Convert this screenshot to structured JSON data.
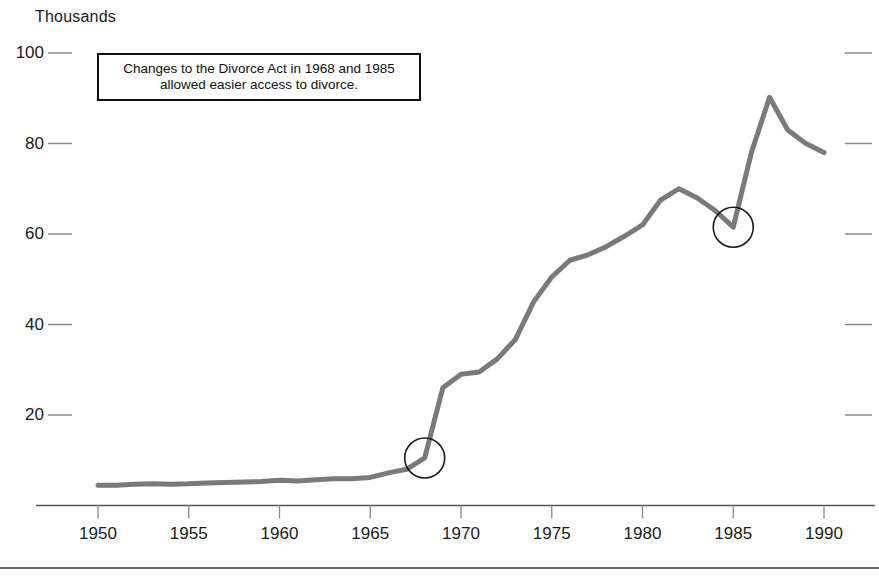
{
  "chart_data": {
    "type": "line",
    "title": "",
    "subtitle": "",
    "xlabel": "",
    "ylabel": "Thousands",
    "unit_label": "Thousands",
    "xlim": [
      1950,
      1990
    ],
    "ylim": [
      0,
      100
    ],
    "grid": false,
    "legend": null,
    "line_color": "#7a7a7a",
    "axis_color": "#555555",
    "tick_color": "#8a8a8a",
    "text_color": "#1a1a1a",
    "x_ticks": [
      1950,
      1955,
      1960,
      1965,
      1970,
      1975,
      1980,
      1985,
      1990
    ],
    "x_tick_labels": [
      "1950",
      "1955",
      "1960",
      "1965",
      "1970",
      "1975",
      "1980",
      "1985",
      "1990"
    ],
    "y_ticks": [
      20,
      40,
      60,
      80,
      100
    ],
    "y_tick_labels": [
      "20",
      "40",
      "60",
      "80",
      "100"
    ],
    "series": [
      {
        "name": "Divorces",
        "x": [
          1950,
          1951,
          1952,
          1953,
          1954,
          1955,
          1956,
          1957,
          1958,
          1959,
          1960,
          1961,
          1962,
          1963,
          1964,
          1965,
          1966,
          1967,
          1968,
          1969,
          1970,
          1971,
          1972,
          1973,
          1974,
          1975,
          1976,
          1977,
          1978,
          1979,
          1980,
          1981,
          1982,
          1983,
          1984,
          1985,
          1986,
          1987,
          1988,
          1989,
          1990
        ],
        "values": [
          4.5,
          4.5,
          4.7,
          4.8,
          4.7,
          4.8,
          5.0,
          5.1,
          5.2,
          5.3,
          5.6,
          5.4,
          5.7,
          5.9,
          5.9,
          6.2,
          7.2,
          8.0,
          10.5,
          26.0,
          29.0,
          29.5,
          32.4,
          36.7,
          45.0,
          50.5,
          54.2,
          55.4,
          57.2,
          59.5,
          62.0,
          67.5,
          70.0,
          68.0,
          65.2,
          61.5,
          78.0,
          90.2,
          83.0,
          80.0,
          78.0
        ]
      }
    ],
    "markers": [
      {
        "name": "divorce-act-1968-marker",
        "x": 1968,
        "y": 10.5,
        "shape": "circle",
        "radius": 20
      },
      {
        "name": "divorce-act-1985-marker",
        "x": 1985,
        "y": 61.5,
        "shape": "circle",
        "radius": 20
      }
    ],
    "annotations": [
      {
        "name": "divorce-act-annotation",
        "lines": [
          "Changes to the Divorce Act in 1968 and 1985",
          "allowed easier access to divorce."
        ]
      }
    ]
  }
}
